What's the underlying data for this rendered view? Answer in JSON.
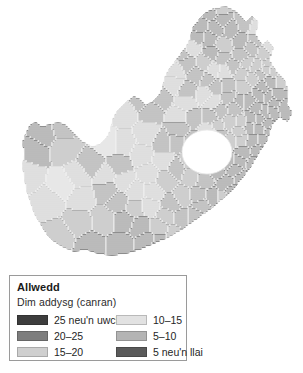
{
  "figure": {
    "name": "south-africa-no-schooling-choropleth",
    "background_color": "#ffffff"
  },
  "legend": {
    "title": "Allwedd",
    "subtitle": "Dim addysg (canran)",
    "border_color": "#9a9a9a",
    "entries": [
      {
        "label": "25 neu'n uwch",
        "color": "#3d3d3d",
        "column": "left"
      },
      {
        "label": "20–25",
        "color": "#7d7d7d",
        "column": "left"
      },
      {
        "label": "15–20",
        "color": "#cfcfcf",
        "column": "left"
      },
      {
        "label": "10–15",
        "color": "#e2e2e2",
        "column": "right"
      },
      {
        "label": "5–10",
        "color": "#b4b4b4",
        "column": "right"
      },
      {
        "label": "5 neu'n llai",
        "color": "#5a5a5a",
        "column": "right"
      }
    ]
  },
  "chart_data": {
    "type": "map",
    "subtype": "choropleth",
    "title": "Allwedd",
    "variable": "Dim addysg (canran)",
    "region": "De Affrica",
    "units": "canran",
    "class_count": 6,
    "classes": [
      {
        "label": "25 neu'n uwch",
        "min": 25,
        "max": null,
        "color": "#3d3d3d"
      },
      {
        "label": "20–25",
        "min": 20,
        "max": 25,
        "color": "#7d7d7d"
      },
      {
        "label": "15–20",
        "min": 15,
        "max": 20,
        "color": "#cfcfcf"
      },
      {
        "label": "10–15",
        "min": 10,
        "max": 15,
        "color": "#e2e2e2"
      },
      {
        "label": "5–10",
        "min": 5,
        "max": 10,
        "color": "#b4b4b4"
      },
      {
        "label": "5 neu'n llai",
        "min": null,
        "max": 5,
        "color": "#5a5a5a"
      }
    ],
    "palette": [
      "#3d3d3d",
      "#7d7d7d",
      "#cfcfcf",
      "#e2e2e2",
      "#b4b4b4",
      "#5a5a5a"
    ],
    "enclave_hole": "Lesotho",
    "grid": false,
    "legend_position": "bottom-left"
  }
}
